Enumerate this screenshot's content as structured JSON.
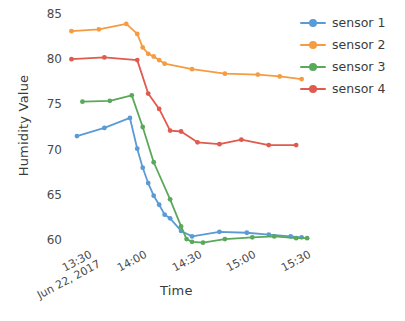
{
  "chart_data": {
    "type": "line",
    "title": "",
    "xlabel": "Time",
    "ylabel": "Humidity Value",
    "xtick_labels": [
      "13:30",
      "14:00",
      "14:30",
      "15:00",
      "15:30"
    ],
    "xtick_date": "Jun 22, 2017",
    "ytick_labels": [
      "85",
      "80",
      "75",
      "70",
      "65",
      "60"
    ],
    "ylim": [
      57.8,
      85.8
    ],
    "xlim_minutes": [
      798,
      948
    ],
    "grid": false,
    "legend_position": "right",
    "series": [
      {
        "name": "sensor 1",
        "color": "#5b9bd5",
        "points": [
          {
            "t": "13:24",
            "x": 804,
            "y": 71.5
          },
          {
            "t": "13:39",
            "x": 819,
            "y": 72.4
          },
          {
            "t": "13:53",
            "x": 833,
            "y": 73.5
          },
          {
            "t": "13:57",
            "x": 837,
            "y": 70.1
          },
          {
            "t": "14:00",
            "x": 840,
            "y": 68.0
          },
          {
            "t": "14:03",
            "x": 843,
            "y": 66.3
          },
          {
            "t": "14:06",
            "x": 846,
            "y": 64.9
          },
          {
            "t": "14:09",
            "x": 849,
            "y": 63.9
          },
          {
            "t": "14:12",
            "x": 852,
            "y": 62.8
          },
          {
            "t": "14:15",
            "x": 855,
            "y": 62.4
          },
          {
            "t": "14:21",
            "x": 861,
            "y": 61.0
          },
          {
            "t": "14:27",
            "x": 867,
            "y": 60.4
          },
          {
            "t": "14:42",
            "x": 882,
            "y": 60.9
          },
          {
            "t": "14:57",
            "x": 897,
            "y": 60.8
          },
          {
            "t": "15:09",
            "x": 909,
            "y": 60.6
          },
          {
            "t": "15:21",
            "x": 921,
            "y": 60.4
          },
          {
            "t": "15:27",
            "x": 927,
            "y": 60.3
          }
        ]
      },
      {
        "name": "sensor 2",
        "color": "#f59b42",
        "points": [
          {
            "t": "13:21",
            "x": 801,
            "y": 83.1
          },
          {
            "t": "13:36",
            "x": 816,
            "y": 83.3
          },
          {
            "t": "13:51",
            "x": 831,
            "y": 83.9
          },
          {
            "t": "13:57",
            "x": 837,
            "y": 82.8
          },
          {
            "t": "14:00",
            "x": 840,
            "y": 81.3
          },
          {
            "t": "14:03",
            "x": 843,
            "y": 80.6
          },
          {
            "t": "14:06",
            "x": 846,
            "y": 80.3
          },
          {
            "t": "14:09",
            "x": 849,
            "y": 79.9
          },
          {
            "t": "14:12",
            "x": 852,
            "y": 79.5
          },
          {
            "t": "14:27",
            "x": 867,
            "y": 78.9
          },
          {
            "t": "14:45",
            "x": 885,
            "y": 78.4
          },
          {
            "t": "15:03",
            "x": 903,
            "y": 78.3
          },
          {
            "t": "15:15",
            "x": 915,
            "y": 78.1
          },
          {
            "t": "15:27",
            "x": 927,
            "y": 77.8
          }
        ]
      },
      {
        "name": "sensor 3",
        "color": "#5aa85a",
        "points": [
          {
            "t": "13:27",
            "x": 807,
            "y": 75.3
          },
          {
            "t": "13:42",
            "x": 822,
            "y": 75.4
          },
          {
            "t": "13:54",
            "x": 834,
            "y": 76.0
          },
          {
            "t": "14:00",
            "x": 840,
            "y": 72.5
          },
          {
            "t": "14:06",
            "x": 846,
            "y": 68.6
          },
          {
            "t": "14:15",
            "x": 855,
            "y": 64.5
          },
          {
            "t": "14:21",
            "x": 861,
            "y": 61.5
          },
          {
            "t": "14:24",
            "x": 864,
            "y": 60.1
          },
          {
            "t": "14:27",
            "x": 867,
            "y": 59.8
          },
          {
            "t": "14:33",
            "x": 873,
            "y": 59.7
          },
          {
            "t": "14:45",
            "x": 885,
            "y": 60.1
          },
          {
            "t": "15:00",
            "x": 900,
            "y": 60.3
          },
          {
            "t": "15:12",
            "x": 912,
            "y": 60.4
          },
          {
            "t": "15:24",
            "x": 924,
            "y": 60.2
          },
          {
            "t": "15:30",
            "x": 930,
            "y": 60.2
          }
        ]
      },
      {
        "name": "sensor 4",
        "color": "#e05a4e",
        "points": [
          {
            "t": "13:21",
            "x": 801,
            "y": 80.0
          },
          {
            "t": "13:39",
            "x": 819,
            "y": 80.2
          },
          {
            "t": "13:57",
            "x": 837,
            "y": 79.9
          },
          {
            "t": "14:03",
            "x": 843,
            "y": 76.2
          },
          {
            "t": "14:09",
            "x": 849,
            "y": 74.5
          },
          {
            "t": "14:15",
            "x": 855,
            "y": 72.1
          },
          {
            "t": "14:21",
            "x": 861,
            "y": 72.0
          },
          {
            "t": "14:30",
            "x": 870,
            "y": 70.8
          },
          {
            "t": "14:42",
            "x": 882,
            "y": 70.6
          },
          {
            "t": "14:54",
            "x": 894,
            "y": 71.1
          },
          {
            "t": "15:09",
            "x": 909,
            "y": 70.5
          },
          {
            "t": "15:24",
            "x": 924,
            "y": 70.5
          }
        ]
      }
    ],
    "legend": [
      {
        "label": "sensor 1",
        "color": "#5b9bd5"
      },
      {
        "label": "sensor 2",
        "color": "#f59b42"
      },
      {
        "label": "sensor 3",
        "color": "#5aa85a"
      },
      {
        "label": "sensor 4",
        "color": "#e05a4e"
      }
    ]
  }
}
